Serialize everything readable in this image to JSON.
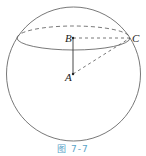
{
  "figure": {
    "caption": "图  7-7",
    "labels": {
      "A": "A",
      "B": "B",
      "C": "C"
    },
    "colors": {
      "stroke": "#555555",
      "caption": "#5aa3c8"
    }
  }
}
